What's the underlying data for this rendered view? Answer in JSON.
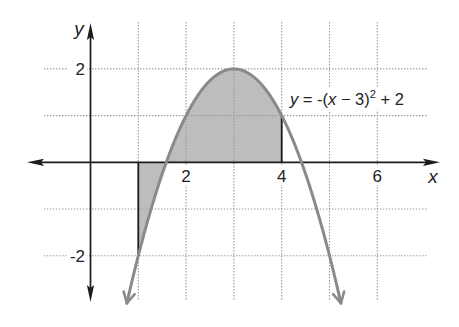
{
  "figure": {
    "axis_labels": {
      "x": "x",
      "y": "y"
    },
    "equation_label": {
      "var_y": "y",
      "part1": " = -(",
      "var_x": "x",
      "part2": " − 3)",
      "exponent": "2",
      "part3": " + 2"
    }
  },
  "chart_data": {
    "type": "line",
    "title": "",
    "xlabel": "x",
    "ylabel": "y",
    "function": "y = -(x - 3)^2 + 2",
    "annotation": "y = -(x − 3)² + 2",
    "parabola": {
      "a": -1,
      "h": 3,
      "k": 2
    },
    "x": [
      1,
      2,
      3,
      4,
      5
    ],
    "series": [
      {
        "name": "y = -(x - 3)^2 + 2",
        "values": [
          -2,
          1,
          2,
          1,
          -2
        ]
      }
    ],
    "curve_domain": [
      0.76,
      5.24
    ],
    "vertex": [
      3,
      2
    ],
    "x_intercepts": [
      1.59,
      4.41
    ],
    "x_ticks": [
      {
        "value": 2,
        "label": "2"
      },
      {
        "value": 4,
        "label": "4"
      },
      {
        "value": 6,
        "label": "6"
      }
    ],
    "y_ticks": [
      {
        "value": 2,
        "label": "2"
      },
      {
        "value": -2,
        "label": "-2"
      }
    ],
    "grid": true,
    "grid_style": "dotted",
    "grid_x": [
      1,
      2,
      3,
      4,
      5,
      6
    ],
    "grid_y": [
      -2,
      -1,
      1,
      2
    ],
    "xlim": [
      -1.3,
      7.3
    ],
    "ylim": [
      -3,
      3
    ],
    "shaded_region": {
      "x_from": 1,
      "x_to": 4,
      "bounded_by": "curve and x-axis"
    },
    "boundary_segments": [
      {
        "x": 1,
        "y_from": 0,
        "y_to": -2
      },
      {
        "x": 4,
        "y_from": 0,
        "y_to": 1
      }
    ],
    "colors": {
      "curve": "#8a8a8a",
      "shading": "#bdbdbd",
      "axes": "#1c1c1c",
      "grid": "#9a9a9a",
      "boundary_segments": "#1c1c1c"
    }
  }
}
